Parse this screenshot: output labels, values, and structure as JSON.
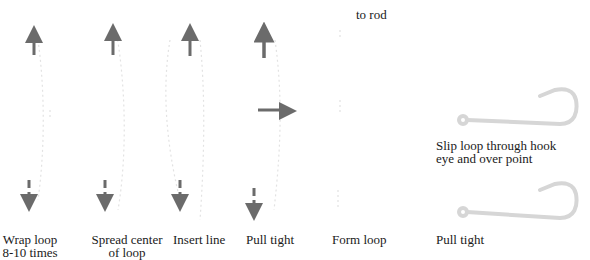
{
  "diagram": {
    "title_fragment": "to rod",
    "colors": {
      "arrow": "#6b6b6b",
      "line_faint": "#dcdcdc",
      "hook": "#d4d4d4",
      "text": "#1a1a1a"
    },
    "steps": [
      {
        "id": "wrap",
        "label_line1": "Wrap loop",
        "label_line2": "8-10 times"
      },
      {
        "id": "spread",
        "label_line1": "Spread center",
        "label_line2": "of loop"
      },
      {
        "id": "insert",
        "label_line1": "Insert line",
        "label_line2": ""
      },
      {
        "id": "pull1",
        "label_line1": "Pull tight",
        "label_line2": ""
      },
      {
        "id": "form",
        "label_line1": "Form loop",
        "label_line2": ""
      },
      {
        "id": "slip",
        "label_line1": "Slip loop through hook",
        "label_line2": "eye and over point"
      },
      {
        "id": "pull2",
        "label_line1": "Pull tight",
        "label_line2": ""
      }
    ]
  }
}
